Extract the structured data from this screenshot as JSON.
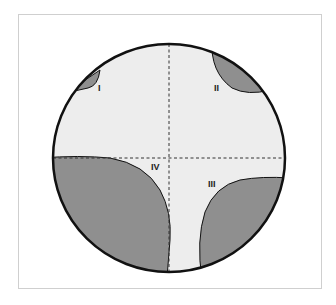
{
  "diagram": {
    "type": "circle-quadrant-diagram",
    "colors": {
      "background": "#ffffff",
      "frame_border": "#cfcfcf",
      "circle_fill": "#ededed",
      "circle_stroke": "#111111",
      "region_fill": "#8f8f8f",
      "dashed_axes": "#333333"
    },
    "regions": [
      {
        "id": "I",
        "label": "I"
      },
      {
        "id": "II",
        "label": "II"
      },
      {
        "id": "III",
        "label": "III"
      },
      {
        "id": "IV",
        "label": "IV"
      }
    ]
  }
}
